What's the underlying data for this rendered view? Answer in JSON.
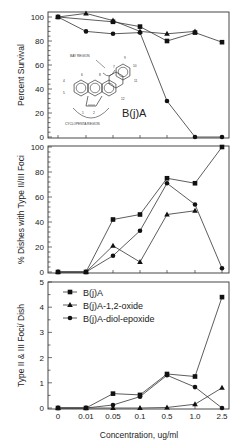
{
  "chart_data": [
    {
      "type": "line",
      "panel": "top",
      "title": "",
      "xlabel": "",
      "ylabel": "Percent Survival",
      "ylim": [
        0,
        100
      ],
      "yticks": [
        "0",
        "20",
        "40",
        "60",
        "80",
        "100"
      ],
      "categories": [
        "0",
        "0.01",
        "0.05",
        "0.1",
        "0.5",
        "1.0",
        "2.5"
      ],
      "grid": false,
      "series": [
        {
          "name": "B(j)A",
          "marker": "square",
          "values": [
            100,
            null,
            96,
            92,
            80,
            87,
            79
          ]
        },
        {
          "name": "B(j)A-1,2-oxide",
          "marker": "triangle",
          "values": [
            100,
            103,
            97,
            88,
            86,
            88,
            null
          ]
        },
        {
          "name": "B(j)A-diol-epoxide",
          "marker": "circle",
          "values": [
            100,
            88,
            86,
            87,
            30,
            0,
            0
          ]
        }
      ],
      "annotations": {
        "molecule_label": "B(j)A",
        "bay_region": "BAY REGION",
        "cyclopenta_region": "CYCLOPENTA REGION",
        "atom_numbers": [
          "1",
          "2",
          "4",
          "5",
          "6",
          "7",
          "8",
          "9",
          "10",
          "11",
          "12"
        ]
      }
    },
    {
      "type": "line",
      "panel": "middle",
      "title": "",
      "xlabel": "",
      "ylabel": "% Dishes with Type II/III Foci",
      "ylim": [
        0,
        100
      ],
      "yticks": [
        "0",
        "20",
        "40",
        "60",
        "80",
        "100"
      ],
      "categories": [
        "0",
        "0.01",
        "0.05",
        "0.1",
        "0.5",
        "1.0",
        "2.5"
      ],
      "grid": false,
      "series": [
        {
          "name": "B(j)A",
          "marker": "square",
          "values": [
            0,
            0,
            42,
            46,
            75,
            71,
            100
          ]
        },
        {
          "name": "B(j)A-1,2-oxide",
          "marker": "triangle",
          "values": [
            0,
            0,
            21,
            8,
            46,
            49,
            null
          ]
        },
        {
          "name": "B(j)A-diol-epoxide",
          "marker": "circle",
          "values": [
            0,
            0,
            13,
            33,
            71,
            54,
            3
          ]
        }
      ]
    },
    {
      "type": "line",
      "panel": "bottom",
      "title": "",
      "xlabel": "Concentration, ug/ml",
      "ylabel": "Type II & III Foci/ Dish",
      "ylim": [
        0,
        5
      ],
      "yticks": [
        "0",
        "1",
        "2",
        "3",
        "4",
        "5"
      ],
      "categories": [
        "0",
        "0.01",
        "0.05",
        "0.1",
        "0.5",
        "1.0",
        "2.5"
      ],
      "grid": false,
      "legend_position": "upper left",
      "series": [
        {
          "name": "B(j)A",
          "marker": "square",
          "values": [
            0,
            0,
            0.57,
            0.52,
            1.35,
            1.25,
            4.4
          ]
        },
        {
          "name": "B(j)A-1,2-oxide",
          "marker": "triangle",
          "values": [
            0,
            0,
            0,
            0,
            0.02,
            0.15,
            0.8
          ]
        },
        {
          "name": "B(j)A-diol-epoxide",
          "marker": "circle",
          "values": [
            0,
            0,
            0.12,
            0.45,
            1.3,
            0.83,
            0
          ]
        }
      ]
    }
  ],
  "legend": {
    "items": [
      {
        "label": "B(j)A",
        "marker": "square"
      },
      {
        "label": "B(j)A-1,2-oxide",
        "marker": "triangle"
      },
      {
        "label": "B(j)A-diol-epoxide",
        "marker": "circle"
      }
    ]
  },
  "colors": {
    "ink": "#222222",
    "background": "#ffffff"
  }
}
